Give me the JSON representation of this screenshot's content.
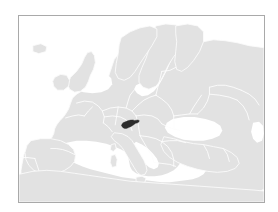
{
  "figure": {
    "kind": "locator-map",
    "region": "Europe",
    "highlighted_country": "Slovenia"
  },
  "colors": {
    "page_background": "#ffffff",
    "frame_border": "#a9a9a9",
    "sea": "#ffffff",
    "land": "#e2e2e2",
    "country_border": "#fbfbfb",
    "highlight": "#2b2b2b"
  },
  "frame": {
    "left": 18,
    "top": 15,
    "width": 247,
    "height": 188
  },
  "highlight_marker": {
    "label": "Slovenia",
    "x": 124,
    "y": 122,
    "width": 11,
    "height": 8
  }
}
